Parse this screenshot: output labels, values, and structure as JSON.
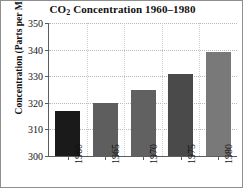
{
  "chart_data": {
    "type": "bar",
    "title_main": "CO",
    "title_sub": "2",
    "title_rest": " Concentration 1960–1980",
    "xlabel": "",
    "ylabel": "Concentration (Parts per Million)",
    "categories": [
      "1960",
      "1965",
      "1970",
      "1975",
      "1980"
    ],
    "values": [
      317,
      320,
      325,
      331,
      339
    ],
    "ylim": [
      300,
      350
    ],
    "yticks": [
      300,
      310,
      320,
      330,
      340,
      350
    ],
    "ytick_labels": [
      "300",
      "310",
      "320",
      "330",
      "340",
      "350"
    ],
    "grid": true,
    "legend": false,
    "bar_colors": [
      "#1a1a1a",
      "#5e5e5e",
      "#616161",
      "#4a4a4a",
      "#797979"
    ]
  }
}
